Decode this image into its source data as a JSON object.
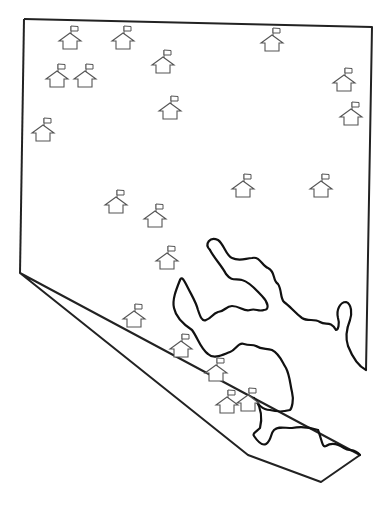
{
  "map": {
    "title": "",
    "boundary_color": "#222222",
    "shoreline_color": "#111111",
    "icon_color": "#555555",
    "icon_type": "schoolhouse-with-flag-icon",
    "schools": [
      {
        "x": 70,
        "y": 28
      },
      {
        "x": 123,
        "y": 28
      },
      {
        "x": 163,
        "y": 52
      },
      {
        "x": 272,
        "y": 30
      },
      {
        "x": 57,
        "y": 66
      },
      {
        "x": 85,
        "y": 66
      },
      {
        "x": 170,
        "y": 98
      },
      {
        "x": 43,
        "y": 120
      },
      {
        "x": 344,
        "y": 70
      },
      {
        "x": 351,
        "y": 104
      },
      {
        "x": 116,
        "y": 192
      },
      {
        "x": 155,
        "y": 206
      },
      {
        "x": 243,
        "y": 176
      },
      {
        "x": 321,
        "y": 176
      },
      {
        "x": 167,
        "y": 248
      },
      {
        "x": 134,
        "y": 306
      },
      {
        "x": 181,
        "y": 336
      },
      {
        "x": 216,
        "y": 360
      },
      {
        "x": 227,
        "y": 392
      },
      {
        "x": 248,
        "y": 390
      }
    ]
  }
}
